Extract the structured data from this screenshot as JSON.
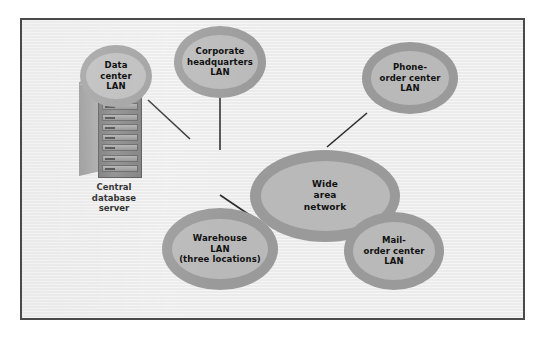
{
  "diagram": {
    "frame": {
      "border_color": "#4a4a4a",
      "background_color": "#ebebeb"
    },
    "style": {
      "node_outer_color": "#9a9a9a",
      "node_inner_color": "#b9b9b9",
      "edge_color": "#2c2c2c",
      "text_color": "#111111"
    },
    "server": {
      "caption": "Central\ndatabase\nserver",
      "icon": "server-tower-icon",
      "bay_count": 8
    },
    "nodes": [
      {
        "id": "wan",
        "label": "Wide\narea\nnetwork",
        "role": "hub"
      },
      {
        "id": "datacenter",
        "label": "Data\ncenter\nLAN",
        "role": "lan"
      },
      {
        "id": "corporate",
        "label": "Corporate\nheadquarters\nLAN",
        "role": "lan"
      },
      {
        "id": "phone",
        "label": "Phone-\norder center\nLAN",
        "role": "lan"
      },
      {
        "id": "warehouse",
        "label": "Warehouse\nLAN\n(three locations)",
        "role": "lan"
      },
      {
        "id": "mail",
        "label": "Mail-\norder center\nLAN",
        "role": "lan"
      }
    ],
    "edges": [
      {
        "from": "server",
        "to": "datacenter"
      },
      {
        "from": "datacenter",
        "to": "wan"
      },
      {
        "from": "corporate",
        "to": "wan"
      },
      {
        "from": "phone",
        "to": "wan"
      },
      {
        "from": "warehouse",
        "to": "wan"
      },
      {
        "from": "mail",
        "to": "wan"
      }
    ]
  }
}
